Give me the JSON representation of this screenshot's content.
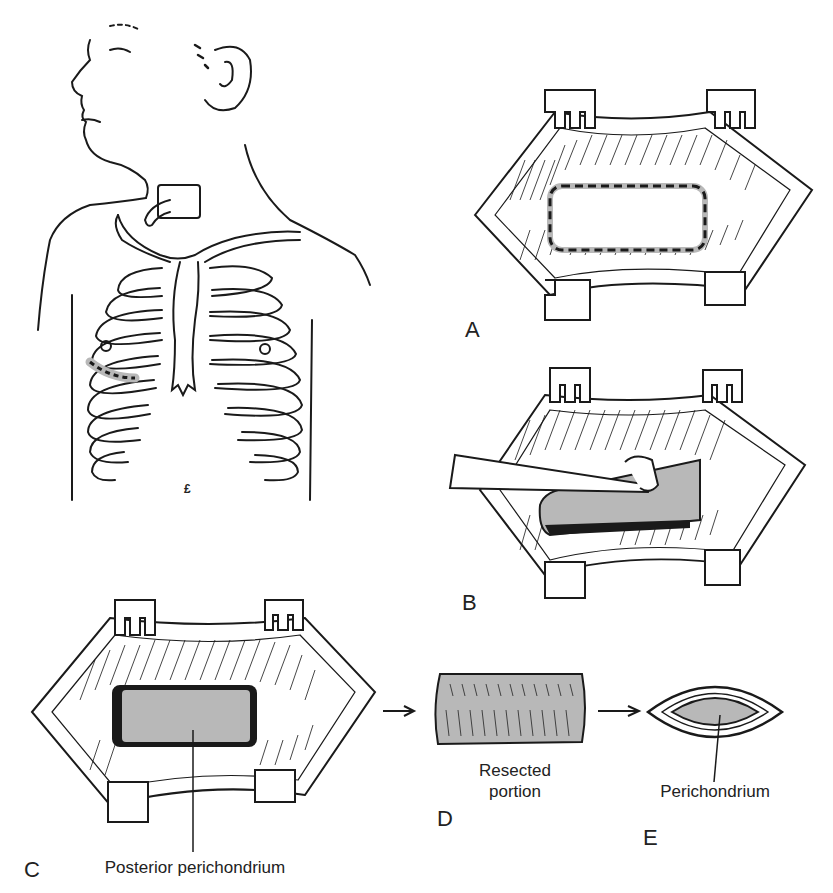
{
  "figure": {
    "panels": [
      {
        "id": "torso",
        "label": "",
        "description": "Patient torso with tracheostomy and rib cage; incision marked over right lower costal cartilage",
        "marker": "£"
      },
      {
        "id": "A",
        "label": "A",
        "description": "Retracted incision exposing costal cartilage with dashed resection outline"
      },
      {
        "id": "B",
        "label": "B",
        "description": "Elevator lifting cartilage segment from perichondrium"
      },
      {
        "id": "C",
        "label": "C",
        "description": "Bed after resection showing posterior perichondrium",
        "caption": "Posterior perichondrium"
      },
      {
        "id": "D",
        "label": "D",
        "description": "Resected cartilage portion",
        "caption_line1": "Resected",
        "caption_line2": "portion"
      },
      {
        "id": "E",
        "label": "E",
        "description": "Cross-section of cartilage with perichondrium",
        "caption": "Perichondrium"
      }
    ],
    "colors": {
      "ink": "#1a1a1a",
      "shade": "#b8b8b8",
      "shade_dark": "#9a9a9a",
      "background": "#ffffff"
    }
  }
}
